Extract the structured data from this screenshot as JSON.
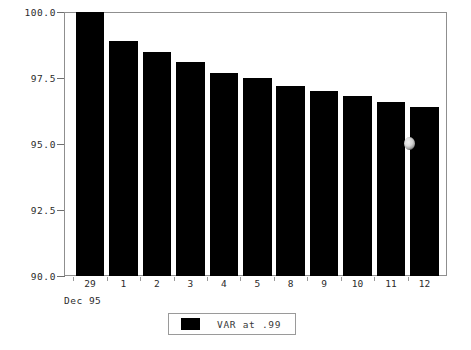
{
  "chart_data": {
    "type": "bar",
    "title": "",
    "subtitle": "",
    "xlabel": "Dec 95",
    "ylabel": "",
    "categories": [
      "29",
      "1",
      "2",
      "3",
      "4",
      "5",
      "8",
      "9",
      "10",
      "11",
      "12"
    ],
    "values": [
      100.0,
      98.9,
      98.5,
      98.1,
      97.7,
      97.5,
      97.2,
      97.0,
      96.8,
      96.6,
      96.4
    ],
    "series": [
      {
        "name": "VAR at .99",
        "color": "#000000",
        "values": [
          100.0,
          98.9,
          98.5,
          98.1,
          97.7,
          97.5,
          97.2,
          97.0,
          96.8,
          96.6,
          96.4
        ]
      }
    ],
    "ylim": [
      90.0,
      100.0
    ],
    "ytick_labels": [
      "100.0",
      "97.5",
      "95.0",
      "92.5",
      "90.0"
    ],
    "ytick_values": [
      100.0,
      97.5,
      95.0,
      92.5,
      90.0
    ],
    "grid": false,
    "legend_position": "bottom-center",
    "bar_color": "#000000",
    "frame_color": "#8f8f8f"
  },
  "axes": {
    "y": {
      "ticks": [
        {
          "label": "100.0",
          "value": 100.0
        },
        {
          "label": "97.5",
          "value": 97.5
        },
        {
          "label": "95.0",
          "value": 95.0
        },
        {
          "label": "92.5",
          "value": 92.5
        },
        {
          "label": "90.0",
          "value": 90.0
        }
      ]
    },
    "x": {
      "caption": "Dec 95",
      "ticks": [
        {
          "label": "29"
        },
        {
          "label": "1"
        },
        {
          "label": "2"
        },
        {
          "label": "3"
        },
        {
          "label": "4"
        },
        {
          "label": "5"
        },
        {
          "label": "8"
        },
        {
          "label": "9"
        },
        {
          "label": "10"
        },
        {
          "label": "11"
        },
        {
          "label": "12"
        }
      ]
    }
  },
  "legend": {
    "entries": [
      {
        "label": "VAR at .99",
        "color": "#000000"
      }
    ]
  },
  "artifacts": {
    "smudge": {
      "name": "scan-artifact-smudge"
    }
  }
}
